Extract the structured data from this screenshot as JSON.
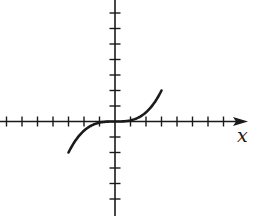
{
  "chart_data": {
    "type": "line",
    "title": "",
    "xlabel": "x",
    "ylabel": "",
    "grid": false,
    "legend": null,
    "x_ticks": [
      -7,
      -6,
      -5,
      -4,
      -3,
      -2,
      -1,
      1,
      2,
      3,
      4,
      5,
      6,
      7
    ],
    "y_ticks": [
      -5,
      -4,
      -3,
      -2,
      -1,
      1,
      2,
      3,
      4,
      5,
      6,
      7
    ],
    "xlim": [
      -7.4,
      8.5
    ],
    "ylim": [
      -6,
      7.8
    ],
    "tick_labels_shown": false,
    "series": [
      {
        "name": "f(x)",
        "description": "decreasing cubic-like curve, flat at origin",
        "x": [
          -3,
          -2.5,
          -2,
          -1.5,
          -1,
          -0.5,
          0,
          0.5,
          1,
          1.5,
          2,
          2.5,
          3
        ],
        "y": [
          2,
          1.16,
          0.59,
          0.25,
          0.07,
          0.01,
          0,
          -0.01,
          -0.07,
          -0.25,
          -0.59,
          -1.16,
          -2
        ]
      }
    ]
  },
  "labels": {
    "x_axis": "x"
  },
  "colors": {
    "ink": "#1a1a1a",
    "background": "#ffffff"
  }
}
